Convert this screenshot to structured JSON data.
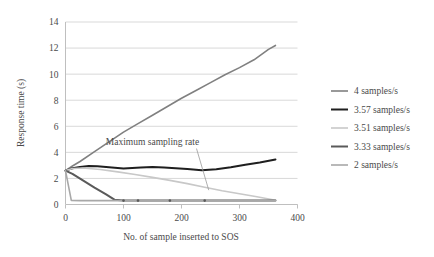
{
  "chart_data": {
    "type": "line",
    "title": "",
    "xlabel": "No. of sample inserted to SOS",
    "ylabel": "Response time (s)",
    "xlim": [
      0,
      400
    ],
    "ylim": [
      0,
      14
    ],
    "xticks": [
      0,
      100,
      200,
      300,
      400
    ],
    "yticks": [
      0,
      2,
      4,
      6,
      8,
      10,
      12,
      14
    ],
    "grid": "horizontal",
    "legend_position": "right",
    "annotations": [
      {
        "text": "Maximum sampling rate",
        "x": 150,
        "y": 4.6,
        "leader_to_x": 247,
        "leader_to_y": 1.1
      }
    ],
    "series": [
      {
        "name": "4 samples/s",
        "color": "#808080",
        "width": 1.6,
        "x": [
          0,
          12,
          25,
          50,
          75,
          100,
          125,
          150,
          175,
          200,
          225,
          250,
          275,
          300,
          325,
          350,
          362
        ],
        "y": [
          2.6,
          2.95,
          3.3,
          4.05,
          4.8,
          5.55,
          6.2,
          6.85,
          7.5,
          8.15,
          8.75,
          9.35,
          9.95,
          10.5,
          11.1,
          11.9,
          12.2
        ]
      },
      {
        "name": "3.57 samples/s",
        "color": "#1f1f1f",
        "width": 2.0,
        "x": [
          0,
          12,
          25,
          40,
          55,
          70,
          85,
          100,
          115,
          130,
          150,
          170,
          190,
          210,
          235,
          260,
          285,
          310,
          335,
          362
        ],
        "y": [
          2.6,
          2.78,
          2.88,
          2.95,
          2.93,
          2.88,
          2.82,
          2.76,
          2.8,
          2.84,
          2.88,
          2.84,
          2.78,
          2.72,
          2.62,
          2.7,
          2.86,
          3.05,
          3.22,
          3.45
        ]
      },
      {
        "name": "3.51 samples/s",
        "color": "#c8c8c8",
        "width": 1.6,
        "x": [
          0,
          12,
          30,
          60,
          90,
          120,
          150,
          180,
          210,
          240,
          270,
          300,
          330,
          362
        ],
        "y": [
          2.6,
          2.76,
          2.8,
          2.68,
          2.5,
          2.3,
          2.08,
          1.85,
          1.6,
          1.32,
          1.05,
          0.82,
          0.6,
          0.33
        ]
      },
      {
        "name": "3.33 samples/s",
        "color": "#5a5a5a",
        "width": 2.0,
        "x": [
          0,
          12,
          30,
          50,
          70,
          85,
          100,
          125,
          150,
          180,
          210,
          235,
          260,
          290,
          320,
          362
        ],
        "y": [
          2.6,
          2.35,
          1.85,
          1.3,
          0.78,
          0.36,
          0.3,
          0.3,
          0.3,
          0.3,
          0.3,
          0.3,
          0.3,
          0.3,
          0.3,
          0.3
        ]
      },
      {
        "name": "2 samples/s",
        "color": "#a8a8a8",
        "width": 1.6,
        "x": [
          0,
          10,
          25,
          50,
          75,
          100,
          125,
          150,
          180,
          210,
          240,
          270,
          300,
          330,
          362
        ],
        "y": [
          2.6,
          0.32,
          0.3,
          0.3,
          0.3,
          0.3,
          0.3,
          0.3,
          0.3,
          0.3,
          0.3,
          0.3,
          0.3,
          0.3,
          0.3
        ]
      }
    ],
    "markers": {
      "series": "3.33 samples/s",
      "x": [
        100,
        125,
        180,
        240
      ],
      "y": [
        0.3,
        0.3,
        0.3,
        0.3
      ]
    }
  },
  "legend": {
    "items": [
      {
        "label": "4 samples/s"
      },
      {
        "label": "3.57 samples/s"
      },
      {
        "label": "3.51 samples/s"
      },
      {
        "label": "3.33 samples/s"
      },
      {
        "label": "2 samples/s"
      }
    ]
  },
  "axes": {
    "y_title": "Response time (s)",
    "x_title": "No. of sample inserted to SOS",
    "y_tick_labels": [
      "0",
      "2",
      "4",
      "6",
      "8",
      "10",
      "12",
      "14"
    ],
    "x_tick_labels": [
      "0",
      "100",
      "200",
      "300",
      "400"
    ]
  },
  "annotation": {
    "text": "Maximum sampling rate"
  },
  "colors": {
    "gridline": "#d9d9d9",
    "axis": "#bfbfbf",
    "text": "#4a4a4a",
    "background": "#ffffff"
  }
}
